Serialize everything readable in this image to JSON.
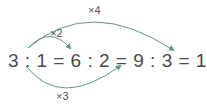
{
  "equation": "3 : 1 = 6 : 2 = 9 : 3 = 12 : 4",
  "arrows": [
    {
      "label": "×2",
      "from": "3 : 1",
      "to": "6 : 2",
      "position": "above"
    },
    {
      "label": "×4",
      "from": "3 : 1",
      "to": "12 : 4",
      "position": "above"
    },
    {
      "label": "×3",
      "from": "3 : 1",
      "to": "9 : 3",
      "position": "below"
    }
  ],
  "colors": {
    "arrow": "#5a9a7e",
    "text": "#4a4a4a"
  }
}
